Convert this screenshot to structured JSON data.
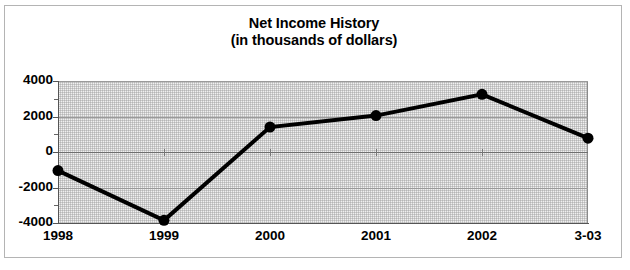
{
  "chart_data": {
    "type": "line",
    "title": "Net Income History",
    "subtitle": "(in thousands of dollars)",
    "xlabel": "",
    "ylabel": "",
    "categories": [
      "1998",
      "1999",
      "2000",
      "2001",
      "2002",
      "3-03"
    ],
    "values": [
      -1050,
      -3850,
      1400,
      2050,
      3250,
      780
    ],
    "series": [
      {
        "name": "Net Income",
        "values": [
          -1050,
          -3850,
          1400,
          2050,
          3250,
          780
        ]
      }
    ],
    "ylim": [
      -4000,
      4000
    ],
    "ytick_labels": [
      "4000",
      "2000",
      "0",
      "-2000",
      "-4000"
    ],
    "ytick_values": [
      4000,
      2000,
      0,
      -2000,
      -4000
    ],
    "yminor_values": [
      3000,
      1000,
      -1000,
      -3000
    ],
    "grid": true,
    "legend": "none",
    "marker": "filled-circle",
    "line_color": "#000000",
    "marker_color": "#000000",
    "plot_background": "#e9e9e9",
    "grid_color": "#9a9a9a",
    "frame_color": "#b4b4b4"
  },
  "chart": {
    "title_line1": "Net Income History",
    "title_line2": "(in thousands of dollars)"
  }
}
